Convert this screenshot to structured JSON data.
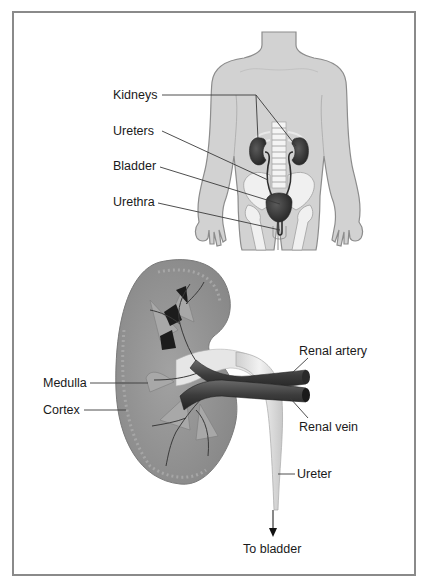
{
  "figure": {
    "body_view": {
      "labels": {
        "kidneys": "Kidneys",
        "ureters": "Ureters",
        "bladder": "Bladder",
        "urethra": "Urethra"
      }
    },
    "kidney_section": {
      "labels": {
        "medulla": "Medulla",
        "cortex": "Cortex",
        "renal_artery": "Renal artery",
        "renal_vein": "Renal vein",
        "ureter": "Ureter",
        "to_bladder": "To bladder"
      }
    }
  },
  "colors": {
    "frame": "#8a8a8a",
    "skin": "#d2d2d2",
    "skin_outline": "#8c8c8c",
    "bone": "#f0f0f0",
    "organ_dark": "#3c3c3c",
    "kidney_tissue": "#8f8f8f",
    "vessel": "#4a4a4a",
    "ureter_fill": "#e2e2e2"
  }
}
